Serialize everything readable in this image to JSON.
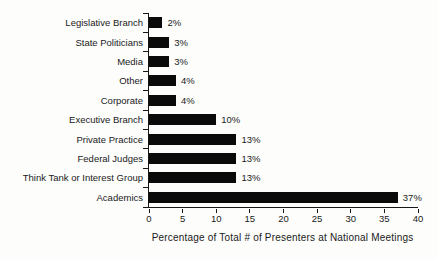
{
  "chart_data": {
    "type": "bar",
    "orientation": "horizontal",
    "title": "",
    "xlabel": "Percentage of Total # of Presenters at National Meetings",
    "ylabel": "",
    "categories": [
      "Legislative Branch",
      "State Politicians",
      "Media",
      "Other",
      "Corporate",
      "Executive Branch",
      "Private Practice",
      "Federal Judges",
      "Think Tank or Interest Group",
      "Academics"
    ],
    "values": [
      2,
      3,
      3,
      4,
      4,
      10,
      13,
      13,
      13,
      37
    ],
    "value_labels": [
      "2%",
      "3%",
      "3%",
      "4%",
      "4%",
      "10%",
      "13%",
      "13%",
      "13%",
      "37%"
    ],
    "x_ticks": [
      0,
      5,
      10,
      15,
      20,
      25,
      30,
      35,
      40
    ],
    "x_tick_labels": [
      "0",
      "5",
      "10",
      "15",
      "20",
      "25",
      "30",
      "35",
      "40"
    ],
    "xlim": [
      0,
      40
    ],
    "grid": false,
    "legend": false,
    "bar_color": "#0a0a0a",
    "text_color": "#1a1a1a",
    "background_color": "#fdfdfc"
  }
}
